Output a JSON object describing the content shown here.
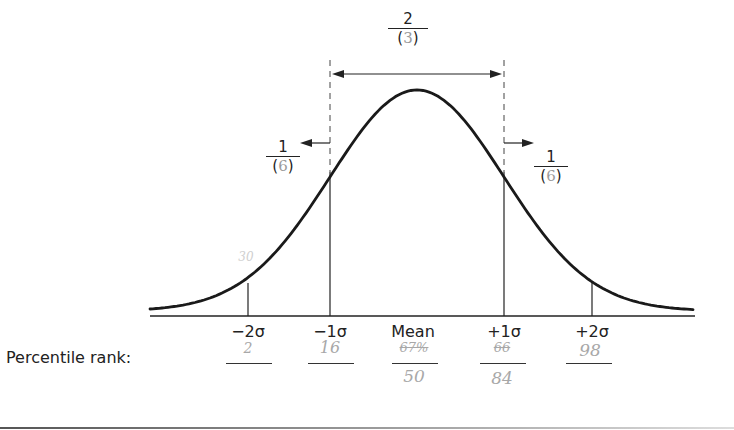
{
  "diagram": {
    "type": "normal-distribution-curve",
    "mean_x": 417,
    "sigma_px": 87,
    "curve_color": "#1a1a1a",
    "center_region": {
      "numerator": "2",
      "denominator_open": "(",
      "denominator_handwritten": "3",
      "denominator_close": ")"
    },
    "left_tail": {
      "numerator": "1",
      "denominator_open": "(",
      "denominator_handwritten": "6",
      "denominator_close": ")"
    },
    "right_tail": {
      "numerator": "1",
      "denominator_open": "(",
      "denominator_handwritten": "6",
      "denominator_close": ")"
    },
    "curve_handwritten_note": "30"
  },
  "axis": {
    "ticks": [
      {
        "label": "−2σ",
        "x": 248
      },
      {
        "label": "−1σ",
        "x": 330
      },
      {
        "label": "Mean",
        "x": 417
      },
      {
        "label": "+1σ",
        "x": 504
      },
      {
        "label": "+2σ",
        "x": 592
      }
    ]
  },
  "percentile": {
    "label": "Percentile rank:",
    "answers": [
      {
        "above": "2",
        "below": ""
      },
      {
        "above": "16",
        "below": ""
      },
      {
        "above": "67%",
        "above_crossed": true,
        "below": "50"
      },
      {
        "above": "66",
        "above_crossed": true,
        "below": "84"
      },
      {
        "above": "98",
        "below": ""
      }
    ]
  }
}
